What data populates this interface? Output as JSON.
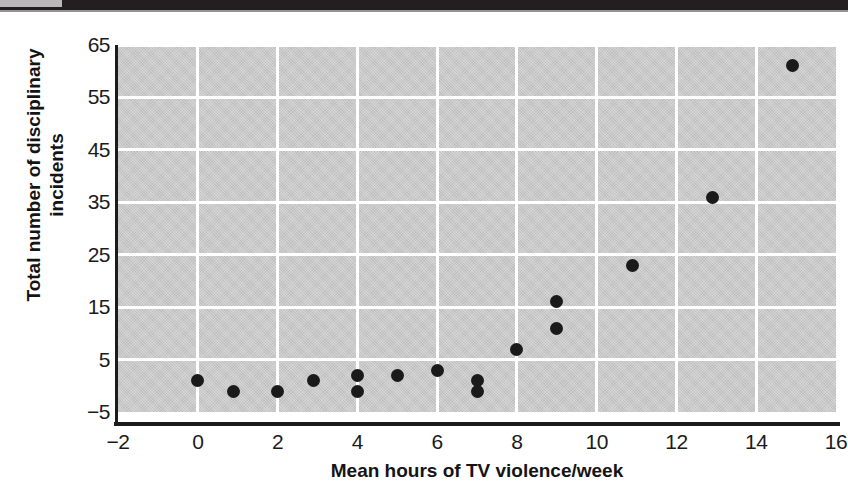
{
  "figure": {
    "background_color": "#ffffff",
    "plot_background_color": "#c9c9c9",
    "grid_color": "#ffffff",
    "axis_color": "#1b1b1b",
    "point_color": "#1a1a1a"
  },
  "chart_data": {
    "type": "scatter",
    "title": "",
    "xlabel": "Mean hours of TV violence/week",
    "ylabel": "Total number of disciplinary incidents",
    "xlim": [
      -2,
      16
    ],
    "ylim": [
      -5,
      65
    ],
    "xticks": [
      -2,
      0,
      2,
      4,
      6,
      8,
      10,
      12,
      14,
      16
    ],
    "xtick_labels": [
      "−2",
      "0",
      "2",
      "4",
      "6",
      "8",
      "10",
      "12",
      "14",
      "16"
    ],
    "yticks": [
      -5,
      5,
      15,
      25,
      35,
      45,
      55,
      65
    ],
    "ytick_labels": [
      "−5",
      "5",
      "15",
      "25",
      "35",
      "45",
      "55",
      "65"
    ],
    "grid": true,
    "grid_orientation": "both",
    "legend": null,
    "marker": "filled-circle",
    "points": [
      {
        "x": 0.0,
        "y": 1
      },
      {
        "x": 0.9,
        "y": -1
      },
      {
        "x": 2.0,
        "y": -1
      },
      {
        "x": 2.9,
        "y": 1
      },
      {
        "x": 4.0,
        "y": 2
      },
      {
        "x": 4.0,
        "y": -1
      },
      {
        "x": 5.0,
        "y": 2
      },
      {
        "x": 6.0,
        "y": 3
      },
      {
        "x": 7.0,
        "y": 1
      },
      {
        "x": 7.0,
        "y": -1
      },
      {
        "x": 8.0,
        "y": 7
      },
      {
        "x": 9.0,
        "y": 16
      },
      {
        "x": 9.0,
        "y": 11
      },
      {
        "x": 10.9,
        "y": 23
      },
      {
        "x": 12.9,
        "y": 36
      },
      {
        "x": 14.9,
        "y": 61
      }
    ]
  }
}
